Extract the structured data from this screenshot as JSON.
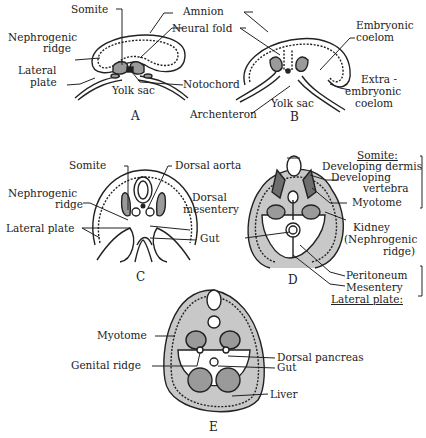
{
  "figure": {
    "panels": {
      "A": {
        "letter": "A",
        "labels": {
          "somite": "Somite",
          "amnion": "Amnion",
          "nephrogenic_ridge_1": "Nephrogenic",
          "nephrogenic_ridge_2": "ridge",
          "neural_fold": "Neural fold",
          "lateral_plate_1": "Lateral",
          "lateral_plate_2": "plate",
          "yolk_sac": "Yolk sac",
          "notochord": "Notochord"
        }
      },
      "B": {
        "letter": "B",
        "labels": {
          "embryonic_coelom_1": "Embryonic",
          "embryonic_coelom_2": "coelom",
          "extraembryonic_1": "Extra -",
          "extraembryonic_2": "embryonic",
          "extraembryonic_3": "coelom",
          "archenteron": "Archenteron",
          "yolk_sac": "Yolk sac"
        }
      },
      "C": {
        "letter": "C",
        "labels": {
          "somite": "Somite",
          "dorsal_aorta": "Dorsal aorta",
          "nephrogenic_ridge_1": "Nephrogenic",
          "nephrogenic_ridge_2": "ridge",
          "dorsal_mesentery_1": "Dorsal",
          "dorsal_mesentery_2": "mesentery",
          "lateral_plate": "Lateral plate",
          "gut": "Gut"
        }
      },
      "D": {
        "letter": "D",
        "labels": {
          "somite_heading": "Somite:",
          "developing_dermis": "Developing dermis",
          "developing_vertebra_1": "Developing",
          "developing_vertebra_2": "vertebra",
          "myotome": "Myotome",
          "kidney_1": "Kidney",
          "kidney_2": "(Nephrogenic",
          "kidney_3": "ridge)",
          "peritoneum": "Peritoneum",
          "mesentery": "Mesentery",
          "lateral_plate_heading": "Lateral plate:"
        }
      },
      "E": {
        "letter": "E",
        "labels": {
          "myotome": "Myotome",
          "genital_ridge": "Genital ridge",
          "dorsal_pancreas": "Dorsal pancreas",
          "gut": "Gut",
          "liver": "Liver"
        }
      }
    },
    "colors": {
      "line": "#222222",
      "mesoderm_fill": "#9a9a9a",
      "dark_fill": "#6e6e6e",
      "background": "#ffffff"
    }
  }
}
